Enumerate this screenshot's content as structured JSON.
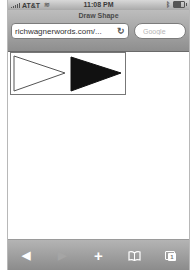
{
  "status_bar": {
    "carrier": "AT&T",
    "time": "11:08 PM"
  },
  "browser": {
    "page_title": "Draw Shape",
    "url": "richwagnerwords.com/...",
    "search_placeholder": "Google"
  },
  "canvas": {
    "shapes": [
      {
        "type": "triangle",
        "fill": "#ffffff",
        "stroke": "#555555",
        "points": "3,3 54,20 3,38"
      },
      {
        "type": "triangle",
        "fill": "#111111",
        "stroke": "#111111",
        "points": "60,4 110,20 60,38"
      }
    ]
  },
  "toolbar": {
    "back_icon": "◀",
    "forward_icon": "▶",
    "add_icon": "+",
    "bookmarks_icon": "📖",
    "pages_count": "1"
  }
}
